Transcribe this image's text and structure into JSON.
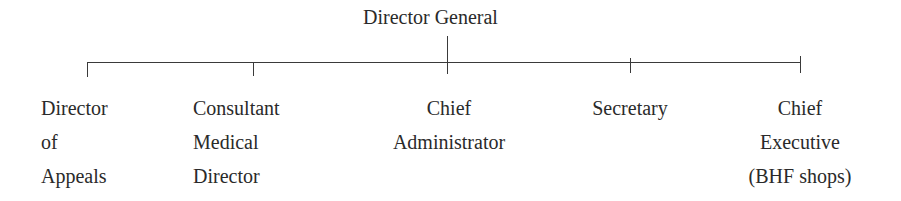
{
  "diagram": {
    "type": "org-chart",
    "root": {
      "label": "Director General"
    },
    "children": [
      {
        "lines": [
          "Director",
          "of",
          "Appeals"
        ]
      },
      {
        "lines": [
          "Consultant",
          "Medical",
          "Director"
        ]
      },
      {
        "lines": [
          "Chief",
          "Administrator"
        ]
      },
      {
        "lines": [
          "Secretary"
        ]
      },
      {
        "lines": [
          "Chief",
          "Executive",
          "(BHF shops)"
        ]
      }
    ]
  }
}
